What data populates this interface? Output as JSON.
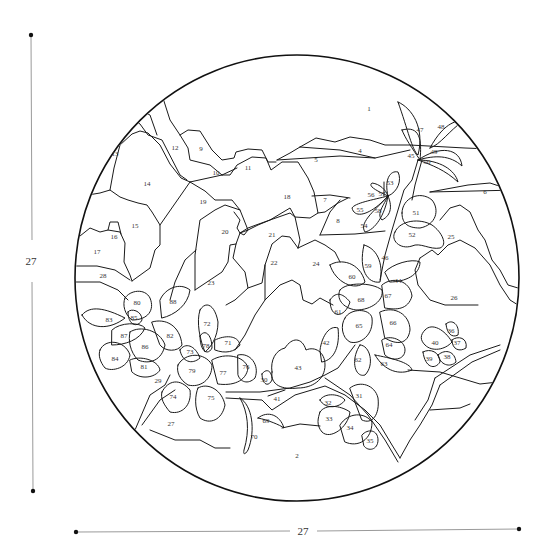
{
  "diagram": {
    "type": "paint-by-number circular stained-glass pattern",
    "stroke_color": "#1a1a1a",
    "background_color": "#ffffff"
  },
  "dimensions": {
    "height_label": "27",
    "width_label": "27"
  },
  "regions": [
    {
      "id": "1",
      "label": "1",
      "x": 369,
      "y": 109
    },
    {
      "id": "2",
      "label": "2",
      "x": 297,
      "y": 456
    },
    {
      "id": "4",
      "label": "4",
      "x": 360,
      "y": 151
    },
    {
      "id": "5",
      "label": "5",
      "x": 316,
      "y": 160
    },
    {
      "id": "6",
      "label": "6",
      "x": 485,
      "y": 192
    },
    {
      "id": "7",
      "label": "7",
      "x": 325,
      "y": 200
    },
    {
      "id": "8",
      "label": "8",
      "x": 338,
      "y": 221
    },
    {
      "id": "9",
      "label": "9",
      "x": 201,
      "y": 149
    },
    {
      "id": "10",
      "label": "10",
      "x": 216,
      "y": 173
    },
    {
      "id": "11",
      "label": "11",
      "x": 248,
      "y": 168
    },
    {
      "id": "12",
      "label": "12",
      "x": 175,
      "y": 148
    },
    {
      "id": "13",
      "label": "13",
      "x": 115,
      "y": 154
    },
    {
      "id": "14",
      "label": "14",
      "x": 147,
      "y": 184
    },
    {
      "id": "15",
      "label": "15",
      "x": 135,
      "y": 226
    },
    {
      "id": "16",
      "label": "16",
      "x": 114,
      "y": 237
    },
    {
      "id": "17",
      "label": "17",
      "x": 97,
      "y": 252
    },
    {
      "id": "18",
      "label": "18",
      "x": 287,
      "y": 197
    },
    {
      "id": "19",
      "label": "19",
      "x": 203,
      "y": 202
    },
    {
      "id": "20",
      "label": "20",
      "x": 225,
      "y": 232
    },
    {
      "id": "21",
      "label": "21",
      "x": 272,
      "y": 235
    },
    {
      "id": "22",
      "label": "22",
      "x": 274,
      "y": 263
    },
    {
      "id": "23",
      "label": "23",
      "x": 211,
      "y": 283
    },
    {
      "id": "24",
      "label": "24",
      "x": 316,
      "y": 264
    },
    {
      "id": "25",
      "label": "25",
      "x": 451,
      "y": 237
    },
    {
      "id": "26",
      "label": "26",
      "x": 454,
      "y": 298
    },
    {
      "id": "27",
      "label": "27",
      "x": 171,
      "y": 424
    },
    {
      "id": "28",
      "label": "28",
      "x": 103,
      "y": 276
    },
    {
      "id": "29",
      "label": "29",
      "x": 158,
      "y": 381
    },
    {
      "id": "30",
      "label": "30",
      "x": 264,
      "y": 380
    },
    {
      "id": "31",
      "label": "31",
      "x": 359,
      "y": 396
    },
    {
      "id": "32",
      "label": "32",
      "x": 328,
      "y": 403
    },
    {
      "id": "33",
      "label": "33",
      "x": 329,
      "y": 419
    },
    {
      "id": "34",
      "label": "34",
      "x": 350,
      "y": 428
    },
    {
      "id": "35",
      "label": "35",
      "x": 370,
      "y": 441
    },
    {
      "id": "36",
      "label": "36",
      "x": 451,
      "y": 331
    },
    {
      "id": "37",
      "label": "37",
      "x": 457,
      "y": 343
    },
    {
      "id": "38",
      "label": "38",
      "x": 447,
      "y": 357
    },
    {
      "id": "39",
      "label": "39",
      "x": 429,
      "y": 359
    },
    {
      "id": "40",
      "label": "40",
      "x": 435,
      "y": 343
    },
    {
      "id": "41",
      "label": "41",
      "x": 277,
      "y": 399
    },
    {
      "id": "42",
      "label": "42",
      "x": 326,
      "y": 343
    },
    {
      "id": "43",
      "label": "43",
      "x": 298,
      "y": 368
    },
    {
      "id": "44",
      "label": "44",
      "x": 398,
      "y": 281
    },
    {
      "id": "45",
      "label": "45",
      "x": 411,
      "y": 156
    },
    {
      "id": "46",
      "label": "46",
      "x": 385,
      "y": 258
    },
    {
      "id": "47",
      "label": "47",
      "x": 420,
      "y": 130
    },
    {
      "id": "48",
      "label": "48",
      "x": 441,
      "y": 127
    },
    {
      "id": "49",
      "label": "49",
      "x": 434,
      "y": 152
    },
    {
      "id": "50",
      "label": "50",
      "x": 427,
      "y": 162
    },
    {
      "id": "51",
      "label": "51",
      "x": 416,
      "y": 213
    },
    {
      "id": "52",
      "label": "52",
      "x": 412,
      "y": 235
    },
    {
      "id": "53",
      "label": "53",
      "x": 390,
      "y": 183
    },
    {
      "id": "54",
      "label": "54",
      "x": 364,
      "y": 226
    },
    {
      "id": "55",
      "label": "55",
      "x": 360,
      "y": 210
    },
    {
      "id": "56",
      "label": "56",
      "x": 371,
      "y": 195
    },
    {
      "id": "57",
      "label": "57",
      "x": 382,
      "y": 194
    },
    {
      "id": "58",
      "label": "58",
      "x": 378,
      "y": 211
    },
    {
      "id": "59",
      "label": "59",
      "x": 368,
      "y": 266
    },
    {
      "id": "60",
      "label": "60",
      "x": 352,
      "y": 277
    },
    {
      "id": "61",
      "label": "61",
      "x": 338,
      "y": 312
    },
    {
      "id": "62",
      "label": "62",
      "x": 358,
      "y": 360
    },
    {
      "id": "63",
      "label": "63",
      "x": 384,
      "y": 364
    },
    {
      "id": "64",
      "label": "64",
      "x": 389,
      "y": 345
    },
    {
      "id": "65",
      "label": "65",
      "x": 359,
      "y": 326
    },
    {
      "id": "66",
      "label": "66",
      "x": 393,
      "y": 323
    },
    {
      "id": "67",
      "label": "67",
      "x": 388,
      "y": 296
    },
    {
      "id": "68",
      "label": "68",
      "x": 361,
      "y": 300
    },
    {
      "id": "69",
      "label": "69",
      "x": 266,
      "y": 421
    },
    {
      "id": "70",
      "label": "70",
      "x": 254,
      "y": 437
    },
    {
      "id": "71",
      "label": "71",
      "x": 228,
      "y": 343
    },
    {
      "id": "72",
      "label": "72",
      "x": 207,
      "y": 324
    },
    {
      "id": "73",
      "label": "73",
      "x": 190,
      "y": 352
    },
    {
      "id": "74",
      "label": "74",
      "x": 173,
      "y": 397
    },
    {
      "id": "75",
      "label": "75",
      "x": 211,
      "y": 398
    },
    {
      "id": "76",
      "label": "76",
      "x": 246,
      "y": 367
    },
    {
      "id": "77",
      "label": "77",
      "x": 223,
      "y": 373
    },
    {
      "id": "78",
      "label": "78",
      "x": 206,
      "y": 346
    },
    {
      "id": "79",
      "label": "79",
      "x": 192,
      "y": 371
    },
    {
      "id": "80",
      "label": "80",
      "x": 137,
      "y": 303
    },
    {
      "id": "81",
      "label": "81",
      "x": 144,
      "y": 367
    },
    {
      "id": "82",
      "label": "82",
      "x": 170,
      "y": 336
    },
    {
      "id": "83",
      "label": "83",
      "x": 109,
      "y": 320
    },
    {
      "id": "84",
      "label": "84",
      "x": 115,
      "y": 359
    },
    {
      "id": "85",
      "label": "85",
      "x": 134,
      "y": 318
    },
    {
      "id": "86",
      "label": "86",
      "x": 145,
      "y": 347
    },
    {
      "id": "87",
      "label": "87",
      "x": 124,
      "y": 336
    },
    {
      "id": "88",
      "label": "88",
      "x": 173,
      "y": 302
    }
  ]
}
